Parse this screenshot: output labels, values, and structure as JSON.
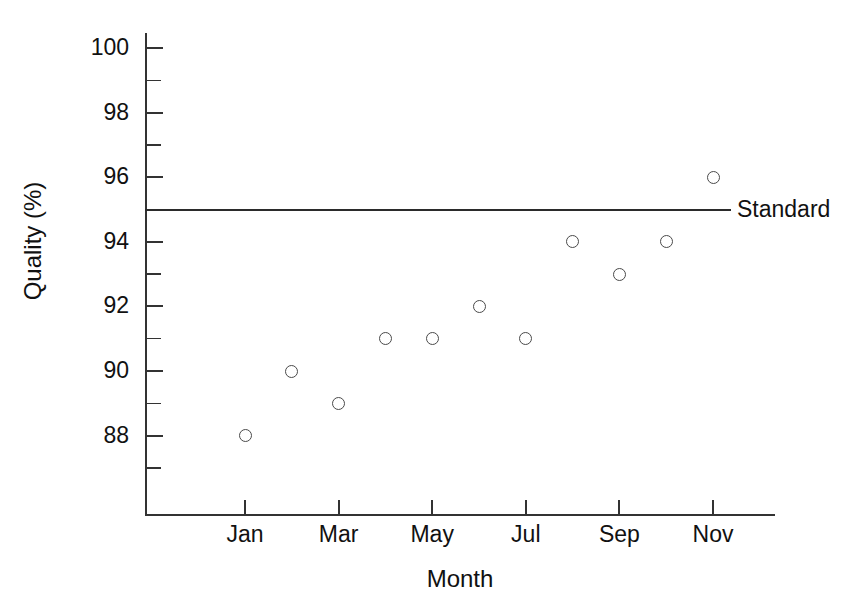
{
  "chart_data": {
    "type": "scatter",
    "title": "",
    "xlabel": "Month",
    "ylabel": "Quality (%)",
    "ylim": [
      87,
      100
    ],
    "yticks_major": [
      88,
      90,
      92,
      94,
      96,
      98,
      100
    ],
    "yticks_minor": [
      87,
      89,
      91,
      93,
      95,
      97,
      99
    ],
    "ytick_labels": [
      "88",
      "90",
      "92",
      "94",
      "96",
      "98",
      "100"
    ],
    "xticks": [
      "Jan",
      "Mar",
      "May",
      "Jul",
      "Sep",
      "Nov"
    ],
    "xlim_months": [
      0,
      12
    ],
    "grid": false,
    "legend": "none",
    "marker": "open-circle",
    "categories": [
      "Jan",
      "Feb",
      "Mar",
      "Apr",
      "May",
      "Jun",
      "Jul",
      "Aug",
      "Sep",
      "Oct",
      "Nov"
    ],
    "values": [
      88,
      90,
      89,
      91,
      91,
      92,
      91,
      94,
      93,
      94,
      96
    ],
    "points": [
      {
        "month": "Jan",
        "x": 1,
        "y": 88
      },
      {
        "month": "Feb",
        "x": 2,
        "y": 90
      },
      {
        "month": "Mar",
        "x": 3,
        "y": 89
      },
      {
        "month": "Apr",
        "x": 4,
        "y": 91
      },
      {
        "month": "May",
        "x": 5,
        "y": 91
      },
      {
        "month": "Jun",
        "x": 6,
        "y": 92
      },
      {
        "month": "Jul",
        "x": 7,
        "y": 91
      },
      {
        "month": "Aug",
        "x": 8,
        "y": 94
      },
      {
        "month": "Sep",
        "x": 9,
        "y": 93
      },
      {
        "month": "Oct",
        "x": 10,
        "y": 94
      },
      {
        "month": "Nov",
        "x": 11,
        "y": 96
      }
    ],
    "reference_lines": [
      {
        "label": "Standard",
        "value": 95,
        "orientation": "horizontal"
      }
    ],
    "colors": {
      "axis": "#333333",
      "marker_stroke": "#4a4a4a",
      "reference_line": "#2b2b2b",
      "text": "#111111",
      "background": "#ffffff"
    }
  }
}
